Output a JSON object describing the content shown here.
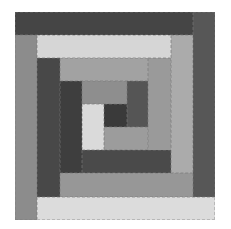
{
  "image": {
    "description": "Log cabin quilt block in grayscale",
    "background": "#ffffff"
  },
  "patches": [
    {
      "name": "outer-top-strip",
      "x": 15,
      "y": 12,
      "w": 178,
      "h": 23,
      "color": "#454545"
    },
    {
      "name": "outer-right-strip",
      "x": 193,
      "y": 12,
      "w": 22,
      "h": 185,
      "color": "#575757"
    },
    {
      "name": "outer-bottom-strip",
      "x": 37,
      "y": 197,
      "w": 178,
      "h": 23,
      "color": "#dcdcdc"
    },
    {
      "name": "outer-left-strip",
      "x": 15,
      "y": 35,
      "w": 22,
      "h": 185,
      "color": "#8c8c8c"
    },
    {
      "name": "ring2-top-strip",
      "x": 37,
      "y": 35,
      "w": 134,
      "h": 23,
      "color": "#d6d6d6"
    },
    {
      "name": "ring2-right-strip",
      "x": 171,
      "y": 35,
      "w": 22,
      "h": 138,
      "color": "#ababab"
    },
    {
      "name": "ring2-bottom-strip",
      "x": 60,
      "y": 173,
      "w": 133,
      "h": 24,
      "color": "#979797"
    },
    {
      "name": "ring2-left-strip",
      "x": 37,
      "y": 58,
      "w": 23,
      "h": 139,
      "color": "#484848"
    },
    {
      "name": "ring3-top-strip",
      "x": 60,
      "y": 58,
      "w": 88,
      "h": 23,
      "color": "#a2a2a2"
    },
    {
      "name": "ring3-right-strip",
      "x": 148,
      "y": 58,
      "w": 23,
      "h": 115,
      "color": "#9a9a9a"
    },
    {
      "name": "ring3-bottom-strip",
      "x": 82,
      "y": 150,
      "w": 89,
      "h": 23,
      "color": "#4a4a4a"
    },
    {
      "name": "ring3-left-strip",
      "x": 60,
      "y": 81,
      "w": 22,
      "h": 92,
      "color": "#3e3e3e"
    },
    {
      "name": "ring4-top-strip",
      "x": 82,
      "y": 81,
      "w": 45,
      "h": 23,
      "color": "#8e8e8e"
    },
    {
      "name": "ring4-right-strip",
      "x": 127,
      "y": 81,
      "w": 21,
      "h": 46,
      "color": "#555555"
    },
    {
      "name": "ring4-left-strip",
      "x": 82,
      "y": 104,
      "w": 22,
      "h": 46,
      "color": "#dadada"
    },
    {
      "name": "center-square",
      "x": 104,
      "y": 104,
      "w": 23,
      "h": 23,
      "color": "#3a3a3a"
    },
    {
      "name": "ring4-bottom-strip",
      "x": 104,
      "y": 127,
      "w": 44,
      "h": 23,
      "color": "#9c9c9c"
    }
  ]
}
